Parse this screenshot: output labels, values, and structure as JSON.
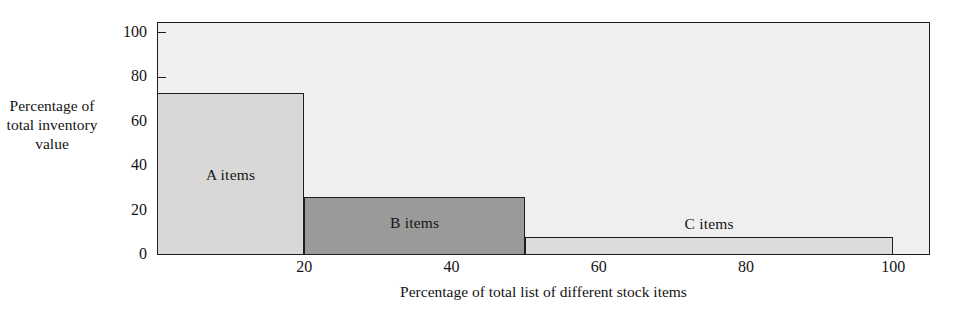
{
  "figure": {
    "top_clipped_text": "",
    "background_color": "#ffffff",
    "plot_background_color": "#f0efef",
    "axis_color": "#1e1e1e"
  },
  "chart_data": {
    "type": "bar",
    "title": "",
    "subtitle": "",
    "xlabel": "Percentage of total list of different stock items",
    "ylabel": "Percentage of total inventory value",
    "xlim": [
      0,
      105
    ],
    "ylim": [
      0,
      105
    ],
    "xticks": [
      20,
      40,
      60,
      80,
      100
    ],
    "xtick_labels": [
      "20",
      "40",
      "60",
      "80",
      "100"
    ],
    "yticks": [
      0,
      20,
      40,
      60,
      80,
      100
    ],
    "ytick_labels": [
      "0",
      "20",
      "40",
      "60",
      "80",
      "100"
    ],
    "grid": false,
    "legend": "none",
    "bars": [
      {
        "name": "A items",
        "label": "A items",
        "x_start": 0,
        "x_end": 20,
        "value": 73,
        "color": "#d9d8d6",
        "label_position": "inside"
      },
      {
        "name": "B items",
        "label": "B items",
        "x_start": 20,
        "x_end": 50,
        "value": 26,
        "color": "#9a9a99",
        "label_position": "inside"
      },
      {
        "name": "C items",
        "label": "C items",
        "x_start": 50,
        "x_end": 100,
        "value": 8,
        "color": "#dddcda",
        "label_position": "above"
      }
    ],
    "categories": [
      "A items",
      "B items",
      "C items"
    ],
    "values": [
      73,
      26,
      8
    ],
    "annotations": []
  }
}
